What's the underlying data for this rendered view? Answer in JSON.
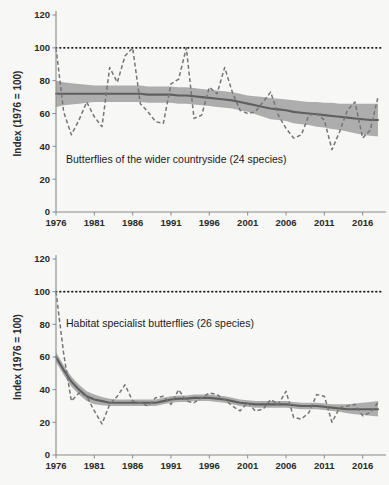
{
  "figure": {
    "background_color": "#f7f7f5",
    "width": 389,
    "height": 485
  },
  "colors": {
    "axis": "#8a8a8a",
    "tick_text": "#2b2b2b",
    "reference_line": "#1a1a1a",
    "confidence_band": "#a6a6a6",
    "trend_line": "#5f5f5f",
    "index_line": "#757575"
  },
  "chart_data": [
    {
      "id": "wider-countryside",
      "type": "line",
      "title": "",
      "annotation": "Butterflies of the wider countryside (24 species)",
      "xlabel": "",
      "ylabel": "Index (1976 = 100)",
      "xlim": [
        1976,
        2018
      ],
      "ylim": [
        0,
        120
      ],
      "yticks": [
        0,
        20,
        40,
        60,
        80,
        100,
        120
      ],
      "xticks": [
        1976,
        1981,
        1986,
        1991,
        1996,
        2001,
        2006,
        2011,
        2016
      ],
      "grid": false,
      "legend": "none",
      "reference_line": {
        "value": 100,
        "style": "dotted",
        "label": "1976 baseline = 100"
      },
      "x": [
        1976,
        1977,
        1978,
        1979,
        1980,
        1981,
        1982,
        1983,
        1984,
        1985,
        1986,
        1987,
        1988,
        1989,
        1990,
        1991,
        1992,
        1993,
        1994,
        1995,
        1996,
        1997,
        1998,
        1999,
        2000,
        2001,
        2002,
        2003,
        2004,
        2005,
        2006,
        2007,
        2008,
        2009,
        2010,
        2011,
        2012,
        2013,
        2014,
        2015,
        2016,
        2017,
        2018
      ],
      "series": [
        {
          "name": "Annual index",
          "style": "dashed",
          "values": [
            100,
            61,
            47,
            56,
            67,
            58,
            52,
            88,
            79,
            95,
            100,
            66,
            61,
            55,
            54,
            78,
            81,
            100,
            57,
            59,
            76,
            72,
            88,
            73,
            62,
            60,
            61,
            67,
            73,
            59,
            51,
            45,
            47,
            59,
            60,
            56,
            38,
            49,
            62,
            67,
            45,
            50,
            70
          ]
        },
        {
          "name": "Smoothed trend",
          "style": "solid",
          "values": [
            72,
            72,
            72,
            72,
            72,
            72,
            72,
            72,
            72,
            72,
            72,
            72,
            71.5,
            71.5,
            71.5,
            71.5,
            71,
            71,
            70.5,
            70,
            69.5,
            69,
            68.5,
            68,
            67,
            66,
            65,
            64,
            63,
            62.5,
            62,
            61,
            60.5,
            60,
            59.5,
            59,
            58.5,
            58,
            57.5,
            57,
            56.5,
            56,
            56
          ]
        },
        {
          "name": "Confidence band upper",
          "style": "band",
          "values": [
            80,
            79,
            78.5,
            78,
            77.5,
            77,
            77,
            77,
            77,
            77,
            77,
            77,
            76.5,
            76.5,
            76.5,
            76.5,
            76,
            76,
            75.5,
            75,
            74.5,
            74,
            73.5,
            73,
            72,
            71,
            70.5,
            70,
            69.5,
            69,
            68.5,
            68,
            67.5,
            67,
            67,
            66.5,
            66.5,
            66,
            66,
            66,
            66,
            66,
            66
          ]
        },
        {
          "name": "Confidence band lower",
          "style": "band",
          "values": [
            64,
            65,
            65.5,
            66,
            66.5,
            67,
            67,
            67,
            67,
            67,
            67,
            67,
            66.5,
            66.5,
            66.5,
            66.5,
            66,
            66,
            65.5,
            65,
            64.5,
            64,
            63.5,
            63,
            62,
            61,
            59.5,
            58,
            56.5,
            56,
            55.5,
            54,
            53.5,
            53,
            52,
            51.5,
            50.5,
            50,
            49,
            48,
            47,
            46.5,
            46
          ]
        }
      ]
    },
    {
      "id": "habitat-specialists",
      "type": "line",
      "title": "",
      "annotation": "Habitat specialist butterflies (26 species)",
      "xlabel": "",
      "ylabel": "Index (1976 = 100)",
      "xlim": [
        1976,
        2018
      ],
      "ylim": [
        0,
        120
      ],
      "yticks": [
        0,
        20,
        40,
        60,
        80,
        100,
        120
      ],
      "xticks": [
        1976,
        1981,
        1986,
        1991,
        1996,
        2001,
        2006,
        2011,
        2016
      ],
      "grid": false,
      "legend": "none",
      "reference_line": {
        "value": 100,
        "style": "dotted",
        "label": "1976 baseline = 100"
      },
      "x": [
        1976,
        1977,
        1978,
        1979,
        1980,
        1981,
        1982,
        1983,
        1984,
        1985,
        1986,
        1987,
        1988,
        1989,
        1990,
        1991,
        1992,
        1993,
        1994,
        1995,
        1996,
        1997,
        1998,
        1999,
        2000,
        2001,
        2002,
        2003,
        2004,
        2005,
        2006,
        2007,
        2008,
        2009,
        2010,
        2011,
        2012,
        2013,
        2014,
        2015,
        2016,
        2017,
        2018
      ],
      "series": [
        {
          "name": "Annual index",
          "style": "dashed",
          "values": [
            100,
            62,
            33,
            38,
            36,
            27,
            19,
            31,
            36,
            43,
            33,
            32,
            30,
            35,
            36,
            31,
            40,
            33,
            32,
            35,
            38,
            37,
            34,
            30,
            27,
            32,
            27,
            28,
            34,
            31,
            39,
            23,
            22,
            26,
            37,
            36,
            20,
            29,
            30,
            31,
            24,
            26,
            32
          ]
        },
        {
          "name": "Smoothed trend",
          "style": "solid",
          "values": [
            60,
            52,
            45,
            40,
            36,
            34,
            33,
            32,
            32,
            32,
            32,
            32,
            32,
            32,
            33,
            34,
            34.5,
            34.5,
            35,
            35,
            35,
            34.5,
            34,
            33,
            32,
            31.5,
            31,
            31,
            31,
            31,
            31,
            30.5,
            30,
            30,
            30,
            29.5,
            29,
            28.5,
            28,
            28,
            28,
            28,
            28
          ]
        },
        {
          "name": "Confidence band upper",
          "style": "band",
          "values": [
            63,
            55,
            48,
            43,
            39,
            37,
            35.5,
            34.5,
            34,
            34,
            34,
            34,
            34,
            34,
            35,
            36,
            36.5,
            36.5,
            37,
            37,
            37,
            36.5,
            36,
            35,
            34,
            33.5,
            33,
            33,
            33,
            33,
            33,
            32.5,
            32,
            32,
            32,
            31.5,
            31,
            31,
            31,
            31.5,
            32,
            32.5,
            33
          ]
        },
        {
          "name": "Confidence band lower",
          "style": "band",
          "values": [
            57,
            49,
            42,
            37,
            33,
            31,
            30.5,
            30,
            30,
            30,
            30,
            30,
            30,
            30,
            31,
            32,
            32.5,
            32.5,
            33,
            33,
            33,
            32.5,
            32,
            31,
            30,
            29.5,
            29,
            29,
            29,
            29,
            29,
            28.5,
            28,
            28,
            28,
            27.5,
            27,
            26.5,
            25.5,
            25,
            24.5,
            24,
            23.5
          ]
        }
      ]
    }
  ]
}
